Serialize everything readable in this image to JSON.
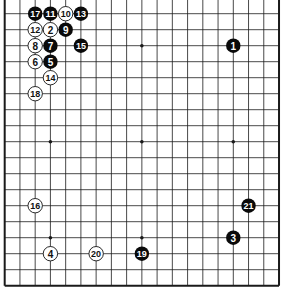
{
  "diagram": {
    "type": "go-board",
    "size": 19,
    "visible_rows": [
      2,
      19
    ],
    "colors": {
      "background": "#ffffff",
      "line": "#1a1a1a",
      "black_stone": "#0a0a0a",
      "white_stone": "#ffffff",
      "black_text": "#ffffff",
      "white_text": "#111111"
    },
    "star_points": [
      {
        "col": 4,
        "row": 4
      },
      {
        "col": 10,
        "row": 4
      },
      {
        "col": 16,
        "row": 4
      },
      {
        "col": 4,
        "row": 10
      },
      {
        "col": 10,
        "row": 10
      },
      {
        "col": 16,
        "row": 10
      },
      {
        "col": 4,
        "row": 16
      },
      {
        "col": 10,
        "row": 16
      },
      {
        "col": 16,
        "row": 16
      }
    ],
    "moves": [
      {
        "n": "1",
        "color": "black",
        "col": 16,
        "row": 4
      },
      {
        "n": "2",
        "color": "white",
        "col": 4,
        "row": 3
      },
      {
        "n": "3",
        "color": "black",
        "col": 16,
        "row": 16
      },
      {
        "n": "4",
        "color": "white",
        "col": 4,
        "row": 17
      },
      {
        "n": "5",
        "color": "black",
        "col": 4,
        "row": 5
      },
      {
        "n": "6",
        "color": "white",
        "col": 3,
        "row": 5
      },
      {
        "n": "7",
        "color": "black",
        "col": 4,
        "row": 4
      },
      {
        "n": "8",
        "color": "white",
        "col": 3,
        "row": 4
      },
      {
        "n": "9",
        "color": "black",
        "col": 5,
        "row": 3
      },
      {
        "n": "10",
        "color": "white",
        "col": 5,
        "row": 2
      },
      {
        "n": "11",
        "color": "black",
        "col": 4,
        "row": 2
      },
      {
        "n": "12",
        "color": "white",
        "col": 3,
        "row": 3
      },
      {
        "n": "13",
        "color": "black",
        "col": 6,
        "row": 2
      },
      {
        "n": "14",
        "color": "white",
        "col": 4,
        "row": 6
      },
      {
        "n": "15",
        "color": "black",
        "col": 6,
        "row": 4
      },
      {
        "n": "16",
        "color": "white",
        "col": 3,
        "row": 14
      },
      {
        "n": "17",
        "color": "black",
        "col": 3,
        "row": 2
      },
      {
        "n": "18",
        "color": "white",
        "col": 3,
        "row": 7
      },
      {
        "n": "19",
        "color": "black",
        "col": 10,
        "row": 17
      },
      {
        "n": "20",
        "color": "white",
        "col": 7,
        "row": 17
      },
      {
        "n": "21",
        "color": "black",
        "col": 17,
        "row": 14
      }
    ]
  }
}
